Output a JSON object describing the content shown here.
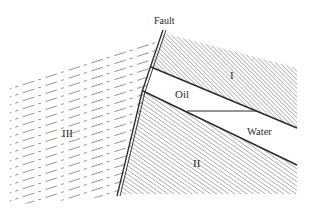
{
  "diagram": {
    "type": "geological-cross-section",
    "labels": {
      "fault": "Fault",
      "layer_1": "I",
      "oil": "Oil",
      "water": "Water",
      "layer_2": "II",
      "layer_3": "III"
    },
    "colors": {
      "line": "#2a2a2a",
      "hatch": "#555555",
      "dash": "#777777",
      "background": "#ffffff"
    }
  }
}
